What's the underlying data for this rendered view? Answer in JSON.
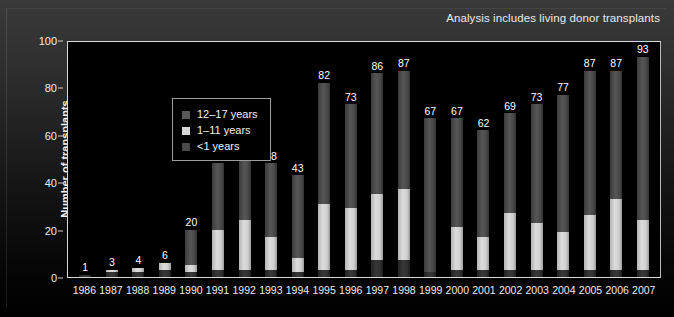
{
  "annotation": "Analysis includes living donor transplants",
  "legend": {
    "items": [
      {
        "key": "s12",
        "label": "12–17 years",
        "color": "#585858"
      },
      {
        "key": "s1",
        "label": "1–11 years",
        "color": "#d6d6d6"
      },
      {
        "key": "s0",
        "label": "<1 years",
        "color": "#4a4a4a"
      }
    ]
  },
  "chart_data": {
    "type": "bar",
    "title": "",
    "subtitle": "",
    "xlabel": "",
    "ylabel": "Number of transplants",
    "ylim": [
      0,
      100
    ],
    "yticks": [
      0,
      20,
      40,
      60,
      80,
      100
    ],
    "grid": false,
    "stacked": true,
    "legend_position": "upper-left-inside",
    "annotations": [
      "Analysis includes living donor transplants"
    ],
    "categories": [
      "1986",
      "1987",
      "1988",
      "1989",
      "1990",
      "1991",
      "1992",
      "1993",
      "1994",
      "1995",
      "1996",
      "1997",
      "1998",
      "1999",
      "2000",
      "2001",
      "2002",
      "2003",
      "2004",
      "2005",
      "2006",
      "2007"
    ],
    "totals": [
      1,
      3,
      4,
      6,
      20,
      48,
      51,
      48,
      43,
      82,
      73,
      86,
      87,
      67,
      67,
      62,
      69,
      73,
      77,
      87,
      87,
      93
    ],
    "series": [
      {
        "name": "<1 years",
        "color": "#4a4a4a",
        "values": [
          1,
          2,
          2,
          3,
          2,
          3,
          3,
          3,
          2,
          3,
          3,
          7,
          7,
          2,
          3,
          3,
          3,
          3,
          3,
          3,
          3,
          3
        ]
      },
      {
        "name": "1-11 years",
        "color": "#d6d6d6",
        "values": [
          0,
          1,
          2,
          3,
          3,
          17,
          21,
          14,
          6,
          28,
          26,
          28,
          30,
          0,
          18,
          14,
          24,
          20,
          16,
          23,
          30,
          21
        ]
      },
      {
        "name": "12-17 years",
        "color": "#585858",
        "values": [
          0,
          0,
          0,
          0,
          15,
          28,
          27,
          31,
          35,
          51,
          44,
          51,
          50,
          65,
          46,
          45,
          42,
          50,
          58,
          61,
          54,
          69
        ]
      }
    ],
    "data_labels": [
      1,
      3,
      4,
      6,
      20,
      48,
      51,
      48,
      43,
      82,
      73,
      86,
      87,
      67,
      67,
      62,
      69,
      73,
      77,
      87,
      87,
      93
    ]
  }
}
